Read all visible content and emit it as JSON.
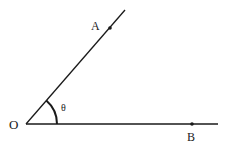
{
  "diagram": {
    "type": "angle",
    "vertex": {
      "label": "O",
      "x": 26,
      "y": 124
    },
    "points": [
      {
        "label": "A",
        "x": 110,
        "y": 28
      },
      {
        "label": "B",
        "x": 192,
        "y": 124
      }
    ],
    "rays": [
      {
        "from": "O",
        "through": "A",
        "end": [
          125,
          10
        ]
      },
      {
        "from": "O",
        "through": "B",
        "end": [
          218,
          124
        ]
      }
    ],
    "angle": {
      "label": "θ",
      "between": [
        "OB",
        "OA"
      ],
      "arc_radius": 31
    },
    "colors": {
      "stroke": "#1a1a1a",
      "background": "#ffffff"
    }
  }
}
